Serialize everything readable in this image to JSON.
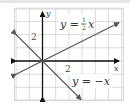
{
  "chart_data": {
    "type": "line",
    "title": "",
    "xlabel": "x",
    "ylabel": "y",
    "xlim": [
      -2,
      6
    ],
    "ylim": [
      -3,
      4
    ],
    "grid": true,
    "grid_step": 1,
    "tick_labels": {
      "x": [
        "2"
      ],
      "y": [
        "2"
      ]
    },
    "series": [
      {
        "name": "y = 1/2 x",
        "label_text": "y = ½x",
        "slope": 0.5,
        "intercept": 0,
        "x": [
          -2,
          6
        ],
        "y": [
          -1,
          3
        ],
        "color": "#555555"
      },
      {
        "name": "y = -x",
        "label_text": "y = −x",
        "slope": -1,
        "intercept": 0,
        "x": [
          -2,
          3
        ],
        "y": [
          2,
          -3
        ],
        "color": "#555555"
      }
    ],
    "axis_color": "#111111",
    "grid_color": "#cccccc"
  },
  "labels": {
    "x_axis": "x",
    "y_axis": "y",
    "x_tick": "2",
    "y_tick": "2",
    "line1_lhs": "y =",
    "line1_num": "1",
    "line1_den": "2",
    "line1_var": "x",
    "line2": "y = −x"
  }
}
